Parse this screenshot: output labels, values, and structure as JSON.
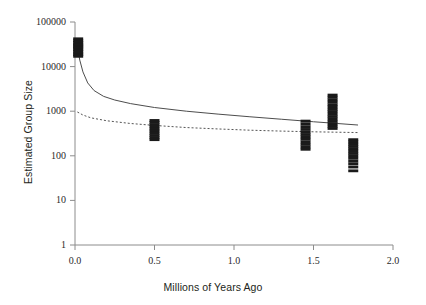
{
  "chart_data": {
    "type": "scatter",
    "title": "",
    "xlabel": "Millions of Years Ago",
    "ylabel": "Estimated Group Size",
    "xlim": [
      0.0,
      2.0
    ],
    "ylim": [
      1,
      100000
    ],
    "yscale": "log",
    "xscale": "linear",
    "grid": false,
    "legend": "none",
    "xticks": [
      "0.0",
      "0.5",
      "1.0",
      "1.5",
      "2.0"
    ],
    "xtick_values": [
      0.0,
      0.5,
      1.0,
      1.5,
      2.0
    ],
    "yticks": [
      "1",
      "10",
      "100",
      "1000",
      "10000",
      "100000"
    ],
    "ytick_values": [
      1,
      10,
      100,
      1000,
      10000,
      100000
    ],
    "series": [
      {
        "name": "data-points",
        "marker": "horizontal-dash",
        "color": "#1a1a1a",
        "points": [
          {
            "x": 0.02,
            "y": 42000
          },
          {
            "x": 0.02,
            "y": 38000
          },
          {
            "x": 0.02,
            "y": 35000
          },
          {
            "x": 0.02,
            "y": 32000
          },
          {
            "x": 0.02,
            "y": 30000
          },
          {
            "x": 0.02,
            "y": 28000
          },
          {
            "x": 0.02,
            "y": 26000
          },
          {
            "x": 0.02,
            "y": 24000
          },
          {
            "x": 0.02,
            "y": 22000
          },
          {
            "x": 0.02,
            "y": 20000
          },
          {
            "x": 0.02,
            "y": 18500
          },
          {
            "x": 0.02,
            "y": 17000
          },
          {
            "x": 0.5,
            "y": 620
          },
          {
            "x": 0.5,
            "y": 560
          },
          {
            "x": 0.5,
            "y": 500
          },
          {
            "x": 0.5,
            "y": 450
          },
          {
            "x": 0.5,
            "y": 400
          },
          {
            "x": 0.5,
            "y": 360
          },
          {
            "x": 0.5,
            "y": 320
          },
          {
            "x": 0.5,
            "y": 285
          },
          {
            "x": 0.5,
            "y": 255
          },
          {
            "x": 0.5,
            "y": 230
          },
          {
            "x": 1.45,
            "y": 600
          },
          {
            "x": 1.45,
            "y": 520
          },
          {
            "x": 1.45,
            "y": 450
          },
          {
            "x": 1.45,
            "y": 390
          },
          {
            "x": 1.45,
            "y": 340
          },
          {
            "x": 1.45,
            "y": 300
          },
          {
            "x": 1.45,
            "y": 265
          },
          {
            "x": 1.45,
            "y": 235
          },
          {
            "x": 1.45,
            "y": 205
          },
          {
            "x": 1.45,
            "y": 180
          },
          {
            "x": 1.45,
            "y": 158
          },
          {
            "x": 1.45,
            "y": 140
          },
          {
            "x": 1.62,
            "y": 2300
          },
          {
            "x": 1.62,
            "y": 2050
          },
          {
            "x": 1.62,
            "y": 1800
          },
          {
            "x": 1.62,
            "y": 1600
          },
          {
            "x": 1.62,
            "y": 1400
          },
          {
            "x": 1.62,
            "y": 1250
          },
          {
            "x": 1.62,
            "y": 1100
          },
          {
            "x": 1.62,
            "y": 980
          },
          {
            "x": 1.62,
            "y": 860
          },
          {
            "x": 1.62,
            "y": 760
          },
          {
            "x": 1.62,
            "y": 670
          },
          {
            "x": 1.62,
            "y": 590
          },
          {
            "x": 1.62,
            "y": 520
          },
          {
            "x": 1.62,
            "y": 460
          },
          {
            "x": 1.62,
            "y": 410
          },
          {
            "x": 1.75,
            "y": 230
          },
          {
            "x": 1.75,
            "y": 205
          },
          {
            "x": 1.75,
            "y": 182
          },
          {
            "x": 1.75,
            "y": 162
          },
          {
            "x": 1.75,
            "y": 144
          },
          {
            "x": 1.75,
            "y": 128
          },
          {
            "x": 1.75,
            "y": 113
          },
          {
            "x": 1.75,
            "y": 100
          },
          {
            "x": 1.75,
            "y": 88
          },
          {
            "x": 1.75,
            "y": 76
          },
          {
            "x": 1.75,
            "y": 66
          },
          {
            "x": 1.75,
            "y": 56
          },
          {
            "x": 1.75,
            "y": 46
          }
        ]
      }
    ],
    "fitted_curves": [
      {
        "name": "solid-regression-curve",
        "style": "solid",
        "color": "#4d4d4d",
        "points": [
          {
            "x": 0.015,
            "y": 27000
          },
          {
            "x": 0.03,
            "y": 14000
          },
          {
            "x": 0.05,
            "y": 7600
          },
          {
            "x": 0.08,
            "y": 4300
          },
          {
            "x": 0.12,
            "y": 2900
          },
          {
            "x": 0.18,
            "y": 2150
          },
          {
            "x": 0.25,
            "y": 1780
          },
          {
            "x": 0.35,
            "y": 1480
          },
          {
            "x": 0.5,
            "y": 1210
          },
          {
            "x": 0.7,
            "y": 1000
          },
          {
            "x": 0.9,
            "y": 860
          },
          {
            "x": 1.1,
            "y": 750
          },
          {
            "x": 1.3,
            "y": 660
          },
          {
            "x": 1.5,
            "y": 580
          },
          {
            "x": 1.65,
            "y": 530
          },
          {
            "x": 1.78,
            "y": 490
          }
        ]
      },
      {
        "name": "dotted-regression-curve",
        "style": "dotted",
        "color": "#555555",
        "points": [
          {
            "x": 0.015,
            "y": 960
          },
          {
            "x": 0.05,
            "y": 820
          },
          {
            "x": 0.1,
            "y": 710
          },
          {
            "x": 0.2,
            "y": 610
          },
          {
            "x": 0.35,
            "y": 530
          },
          {
            "x": 0.5,
            "y": 480
          },
          {
            "x": 0.7,
            "y": 430
          },
          {
            "x": 0.9,
            "y": 400
          },
          {
            "x": 1.1,
            "y": 375
          },
          {
            "x": 1.3,
            "y": 358
          },
          {
            "x": 1.5,
            "y": 345
          },
          {
            "x": 1.65,
            "y": 338
          },
          {
            "x": 1.78,
            "y": 332
          }
        ]
      }
    ]
  },
  "axes": {
    "x_title": "Millions of Years Ago",
    "y_title": "Estimated Group Size",
    "x_tick_labels": [
      "0.0",
      "0.5",
      "1.0",
      "1.5",
      "2.0"
    ],
    "y_tick_labels": [
      "100000",
      "10000",
      "1000",
      "100",
      "10",
      "1"
    ]
  },
  "colors": {
    "axis": "#8c8c8c",
    "point": "#1a1a1a",
    "solid_curve": "#4d4d4d",
    "dotted_curve": "#555555",
    "text": "#231f20"
  }
}
